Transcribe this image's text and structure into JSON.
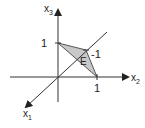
{
  "diagram": {
    "type": "3d-coordinate-system",
    "axes": {
      "x1": {
        "label": "x",
        "subscript": "1"
      },
      "x2": {
        "label": "x",
        "subscript": "2"
      },
      "x3": {
        "label": "x",
        "subscript": "3"
      }
    },
    "ticks": {
      "x3_tick": "1",
      "x2_tick": "1",
      "x1_tick": "-1"
    },
    "plane_label": "E",
    "colors": {
      "axis": "#333333",
      "fill": "#c8c8c8",
      "edge": "#555555"
    }
  }
}
